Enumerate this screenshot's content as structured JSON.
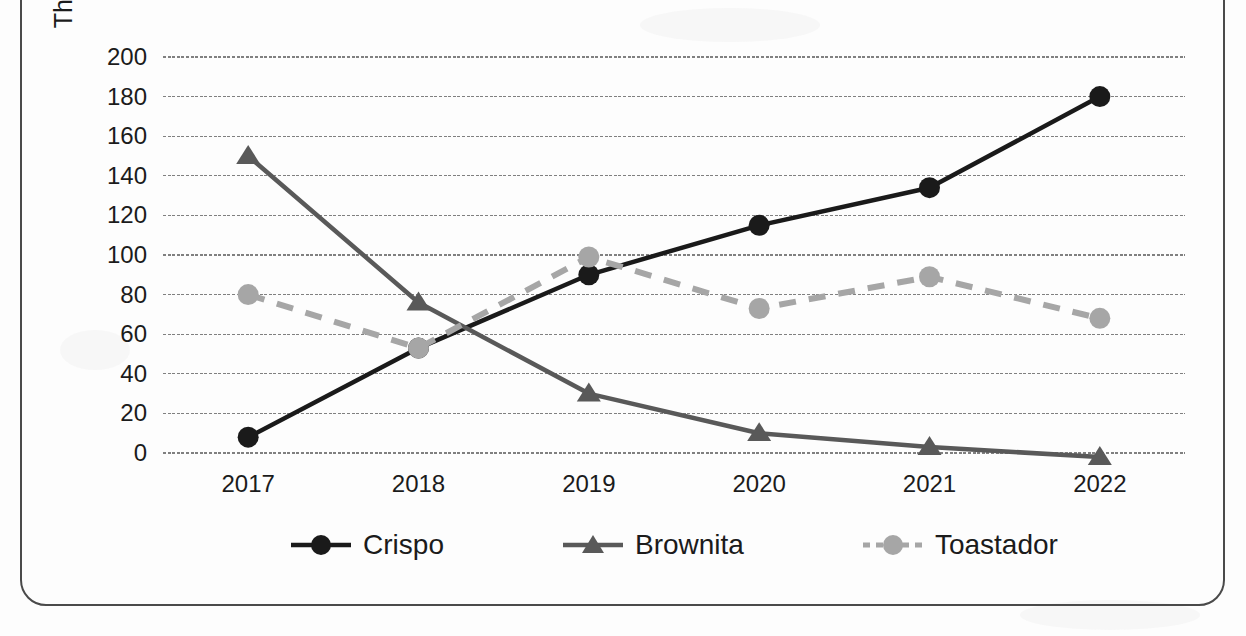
{
  "chart_data": {
    "type": "line",
    "title": "",
    "subtitle": "",
    "xlabel": "",
    "ylabel": "Thousands of Units Sold",
    "categories": [
      "2017",
      "2018",
      "2019",
      "2020",
      "2021",
      "2022"
    ],
    "ylim": [
      0,
      200
    ],
    "ytick_step": 20,
    "yticks": [
      "200",
      "180",
      "160",
      "140",
      "120",
      "100",
      "80",
      "60",
      "40",
      "20",
      "0"
    ],
    "grid": "horizontal-only",
    "legend_position": "bottom-center",
    "series": [
      {
        "name": "Crispo",
        "values": [
          8,
          53,
          90,
          115,
          134,
          180
        ],
        "color": "#1a1a1a",
        "line_style": "solid",
        "marker": "circle"
      },
      {
        "name": "Brownita",
        "values": [
          150,
          76,
          30,
          10,
          3,
          -2
        ],
        "color": "#595959",
        "line_style": "solid",
        "marker": "triangle"
      },
      {
        "name": "Toastador",
        "values": [
          80,
          53,
          99,
          73,
          89,
          68
        ],
        "color": "#a6a6a6",
        "line_style": "dashed",
        "marker": "circle"
      }
    ]
  },
  "axis": {
    "y_title": "Thousands of Units Sold"
  },
  "legend": {
    "items": [
      {
        "label": "Crispo"
      },
      {
        "label": "Brownita"
      },
      {
        "label": "Toastador"
      }
    ]
  },
  "colors": {
    "crispo": "#1a1a1a",
    "brownita": "#595959",
    "toastador": "#a6a6a6",
    "gridline": "#808080",
    "frame": "#4a4a4a",
    "text": "#1b1b1b"
  }
}
